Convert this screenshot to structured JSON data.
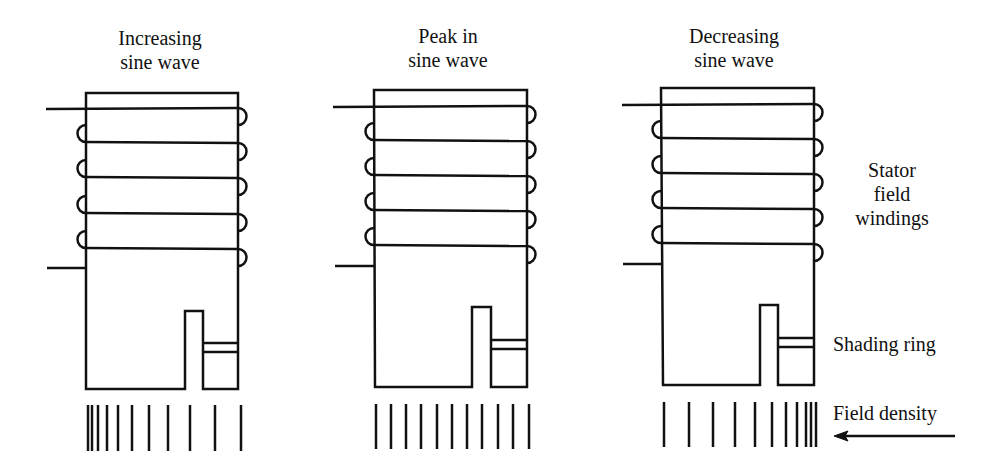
{
  "diagram": {
    "type": "shaded-pole motor field diagram",
    "stroke_color": "#111111",
    "background": "#ffffff",
    "panels": [
      {
        "id": "increasing",
        "title_line1": "Increasing",
        "title_line2": "sine wave",
        "field_density_lines": 11,
        "field_density_distribution": "dense on left (unshaded side), sparse on right",
        "field_line_x": [
          88,
          92,
          98,
          107,
          118,
          132,
          149,
          168,
          190,
          215,
          241
        ]
      },
      {
        "id": "peak",
        "title_line1": "Peak in",
        "title_line2": "sine wave",
        "field_density_lines": 11,
        "field_density_distribution": "uniform",
        "field_line_x": [
          376,
          391,
          406,
          421,
          437,
          452,
          467,
          482,
          498,
          513,
          529
        ]
      },
      {
        "id": "decreasing",
        "title_line1": "Decreasing",
        "title_line2": "sine wave",
        "field_density_lines": 11,
        "field_density_distribution": "sparse on left, dense on right (shaded side)",
        "field_line_x": [
          664,
          689,
          713,
          735,
          755,
          772,
          786,
          797,
          806,
          811,
          816
        ]
      }
    ],
    "labels": {
      "stator_line1": "Stator",
      "stator_line2": "field",
      "stator_line3": "windings",
      "shading_ring": "Shading ring",
      "field_density": "Field density",
      "arrow_direction": "left"
    }
  }
}
